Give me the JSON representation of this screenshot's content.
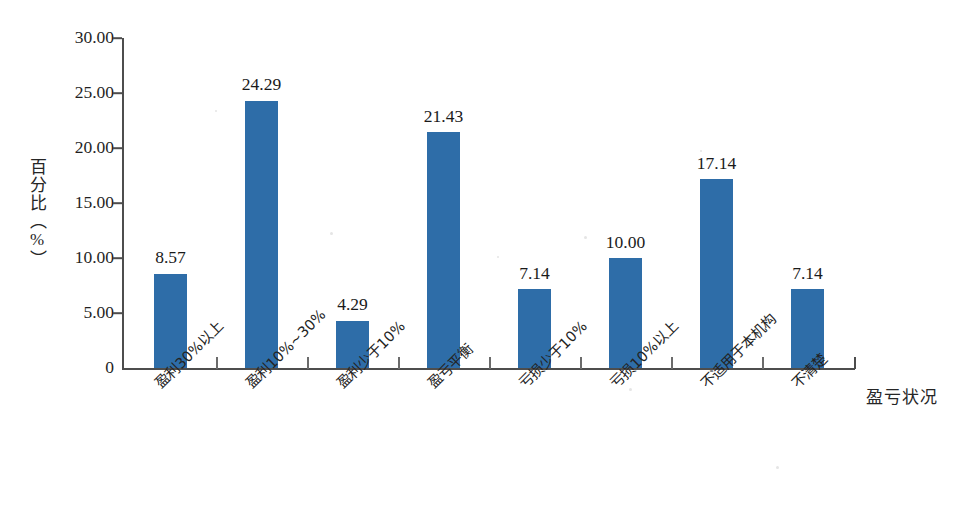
{
  "chart_data": {
    "type": "bar",
    "title": "",
    "subtitle": "",
    "xlabel": "盈亏状况",
    "ylabel": "百分比（%）",
    "categories": [
      "盈利30%以上",
      "盈利10%~30%",
      "盈利少于10%",
      "盈亏平衡",
      "亏损少于10%",
      "亏损10%以上",
      "不适用于本机构",
      "不清楚"
    ],
    "values": [
      8.57,
      24.29,
      4.29,
      21.43,
      7.14,
      10.0,
      17.14,
      7.14
    ],
    "value_labels": [
      "8.57",
      "24.29",
      "4.29",
      "21.43",
      "7.14",
      "10.00",
      "17.14",
      "7.14"
    ],
    "ylim": [
      0,
      30
    ],
    "ytick_values": [
      30,
      25,
      20,
      15,
      10,
      5,
      0
    ],
    "ytick_labels": [
      "30.00",
      "25.00",
      "20.00",
      "15.00",
      "10.00",
      "5.00",
      "0"
    ],
    "grid": false,
    "legend": false,
    "legend_position": "none",
    "bar_color": "#2e6da8",
    "axis_color": "#4d4d4d",
    "background_color": "#ffffff",
    "series": [
      {
        "name": "百分比",
        "values": [
          8.57,
          24.29,
          4.29,
          21.43,
          7.14,
          10.0,
          17.14,
          7.14
        ]
      }
    ]
  }
}
